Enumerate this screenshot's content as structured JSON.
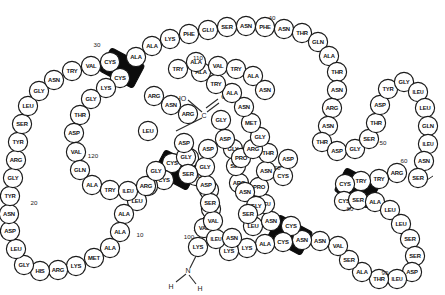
{
  "diagram": {
    "colors": {
      "circle_fill": "#ffffff",
      "circle_stroke": "#1a1a1a",
      "bridge_fill": "#0c0c0c",
      "text": "#111111"
    },
    "n_terminus": {
      "atom": "N",
      "hydrogen_left": "H",
      "hydrogen_right": "H"
    },
    "c_terminus": {
      "hydroxyl": "HO",
      "carbon": "C",
      "oxygen": "O"
    },
    "position_numbers": [
      {
        "label": "10",
        "x": 140,
        "y": 234
      },
      {
        "label": "20",
        "x": 34,
        "y": 202
      },
      {
        "label": "30",
        "x": 97,
        "y": 44
      },
      {
        "label": "40",
        "x": 272,
        "y": 17
      },
      {
        "label": "50",
        "x": 383,
        "y": 142
      },
      {
        "label": "60",
        "x": 404,
        "y": 160
      },
      {
        "label": "70",
        "x": 277,
        "y": 167
      },
      {
        "label": "80",
        "x": 350,
        "y": 208
      },
      {
        "label": "90",
        "x": 385,
        "y": 272
      },
      {
        "label": "100",
        "x": 189,
        "y": 236
      },
      {
        "label": "110",
        "x": 198,
        "y": 57
      },
      {
        "label": "120",
        "x": 93,
        "y": 155
      }
    ],
    "disulfide_bridges": [
      {
        "name": "bridge-cys-30",
        "x": 122,
        "y": 68,
        "angle": -62
      },
      {
        "name": "bridge-cys-117",
        "x": 176,
        "y": 170,
        "angle": -62
      },
      {
        "name": "bridge-cys-80",
        "x": 357,
        "y": 188,
        "angle": -62
      },
      {
        "name": "bridge-cys-85",
        "x": 290,
        "y": 235,
        "angle": -62
      }
    ],
    "residues": [
      {
        "label": "LYS",
        "x": 198,
        "y": 247
      },
      {
        "label": "VAL",
        "x": 204,
        "y": 228
      },
      {
        "label": "PHE",
        "x": 211,
        "y": 209
      },
      {
        "label": "GLY",
        "x": 209,
        "y": 190
      },
      {
        "label": "ARG",
        "x": 196,
        "y": 176
      },
      {
        "label": "ARG",
        "x": 189,
        "y": 158
      },
      {
        "label": "CYS",
        "x": 172,
        "y": 163
      },
      {
        "label": "CYS",
        "x": 164,
        "y": 180
      },
      {
        "label": "GLU",
        "x": 148,
        "y": 186
      },
      {
        "label": "LEU",
        "x": 137,
        "y": 201
      },
      {
        "label": "ALA",
        "x": 124,
        "y": 214
      },
      {
        "label": "ALA",
        "x": 120,
        "y": 232
      },
      {
        "label": "ALA",
        "x": 110,
        "y": 248
      },
      {
        "label": "MET",
        "x": 94,
        "y": 258
      },
      {
        "label": "LYS",
        "x": 76,
        "y": 266
      },
      {
        "label": "ARG",
        "x": 58,
        "y": 270
      },
      {
        "label": "HIS",
        "x": 40,
        "y": 271
      },
      {
        "label": "GLY",
        "x": 24,
        "y": 265
      },
      {
        "label": "LEU",
        "x": 16,
        "y": 249
      },
      {
        "label": "ASP",
        "x": 10,
        "y": 231
      },
      {
        "label": "ASN",
        "x": 9,
        "y": 214
      },
      {
        "label": "TYR",
        "x": 10,
        "y": 196
      },
      {
        "label": "GLY",
        "x": 13,
        "y": 178
      },
      {
        "label": "ARG",
        "x": 16,
        "y": 160
      },
      {
        "label": "TYR",
        "x": 18,
        "y": 142
      },
      {
        "label": "SER",
        "x": 22,
        "y": 124
      },
      {
        "label": "LEU",
        "x": 28,
        "y": 106
      },
      {
        "label": "GLY",
        "x": 39,
        "y": 91
      },
      {
        "label": "ASN",
        "x": 54,
        "y": 80
      },
      {
        "label": "TRY",
        "x": 72,
        "y": 71
      },
      {
        "label": "VAL",
        "x": 91,
        "y": 66
      },
      {
        "label": "CYS",
        "x": 110,
        "y": 62
      },
      {
        "label": "CYS",
        "x": 120,
        "y": 78
      },
      {
        "label": "LYS",
        "x": 106,
        "y": 88
      },
      {
        "label": "GLY",
        "x": 91,
        "y": 99
      },
      {
        "label": "THR",
        "x": 80,
        "y": 115
      },
      {
        "label": "ASP",
        "x": 74,
        "y": 133
      },
      {
        "label": "VAL",
        "x": 76,
        "y": 152
      },
      {
        "label": "GLN",
        "x": 80,
        "y": 170
      },
      {
        "label": "ALA",
        "x": 92,
        "y": 185
      },
      {
        "label": "TRY",
        "x": 110,
        "y": 190
      },
      {
        "label": "ILEU",
        "x": 128,
        "y": 191
      },
      {
        "label": "ARG",
        "x": 146,
        "y": 186
      },
      {
        "label": "GLY",
        "x": 156,
        "y": 171
      },
      {
        "label": "ALA",
        "x": 136,
        "y": 57
      },
      {
        "label": "ALA",
        "x": 152,
        "y": 46
      },
      {
        "label": "LYS",
        "x": 170,
        "y": 39
      },
      {
        "label": "PHE",
        "x": 189,
        "y": 34
      },
      {
        "label": "GLU",
        "x": 208,
        "y": 30
      },
      {
        "label": "SER",
        "x": 227,
        "y": 27
      },
      {
        "label": "ASN",
        "x": 246,
        "y": 26
      },
      {
        "label": "PHE",
        "x": 265,
        "y": 27
      },
      {
        "label": "ASN",
        "x": 284,
        "y": 29
      },
      {
        "label": "THR",
        "x": 302,
        "y": 33
      },
      {
        "label": "GLN",
        "x": 318,
        "y": 42
      },
      {
        "label": "ALA",
        "x": 329,
        "y": 56
      },
      {
        "label": "THR",
        "x": 337,
        "y": 72
      },
      {
        "label": "ASN",
        "x": 337,
        "y": 90
      },
      {
        "label": "ARG",
        "x": 332,
        "y": 108
      },
      {
        "label": "ASN",
        "x": 328,
        "y": 126
      },
      {
        "label": "THR",
        "x": 322,
        "y": 142
      },
      {
        "label": "ASP",
        "x": 337,
        "y": 151
      },
      {
        "label": "GLY",
        "x": 355,
        "y": 149
      },
      {
        "label": "SER",
        "x": 369,
        "y": 139
      },
      {
        "label": "THR",
        "x": 376,
        "y": 123
      },
      {
        "label": "ASP",
        "x": 380,
        "y": 105
      },
      {
        "label": "TYR",
        "x": 388,
        "y": 89
      },
      {
        "label": "GLY",
        "x": 404,
        "y": 82
      },
      {
        "label": "ILEU",
        "x": 418,
        "y": 92
      },
      {
        "label": "LEU",
        "x": 425,
        "y": 108
      },
      {
        "label": "GLN",
        "x": 428,
        "y": 126
      },
      {
        "label": "ILEU",
        "x": 428,
        "y": 144
      },
      {
        "label": "ASN",
        "x": 424,
        "y": 161
      },
      {
        "label": "SER",
        "x": 418,
        "y": 178
      },
      {
        "label": "ARG",
        "x": 397,
        "y": 173
      },
      {
        "label": "TRY",
        "x": 379,
        "y": 179
      },
      {
        "label": "TRY",
        "x": 361,
        "y": 181
      },
      {
        "label": "CYS",
        "x": 345,
        "y": 184
      },
      {
        "label": "CYS",
        "x": 344,
        "y": 201
      },
      {
        "label": "SER",
        "x": 358,
        "y": 200
      },
      {
        "label": "ALA",
        "x": 375,
        "y": 202
      },
      {
        "label": "LEU",
        "x": 390,
        "y": 210
      },
      {
        "label": "LEU",
        "x": 401,
        "y": 224
      },
      {
        "label": "SER",
        "x": 410,
        "y": 239
      },
      {
        "label": "SER",
        "x": 415,
        "y": 256
      },
      {
        "label": "ASP",
        "x": 412,
        "y": 272
      },
      {
        "label": "ILEU",
        "x": 397,
        "y": 279
      },
      {
        "label": "THR",
        "x": 379,
        "y": 279
      },
      {
        "label": "ALA",
        "x": 362,
        "y": 272
      },
      {
        "label": "SER",
        "x": 349,
        "y": 260
      },
      {
        "label": "VAL",
        "x": 338,
        "y": 246
      },
      {
        "label": "ASN",
        "x": 320,
        "y": 241
      },
      {
        "label": "ASN",
        "x": 302,
        "y": 240
      },
      {
        "label": "CYS",
        "x": 291,
        "y": 226
      },
      {
        "label": "CYS",
        "x": 283,
        "y": 242
      },
      {
        "label": "ALA",
        "x": 265,
        "y": 244
      },
      {
        "label": "LYS",
        "x": 247,
        "y": 248
      },
      {
        "label": "LYS",
        "x": 229,
        "y": 251
      },
      {
        "label": "ILEU",
        "x": 216,
        "y": 239
      },
      {
        "label": "VAL",
        "x": 213,
        "y": 221
      },
      {
        "label": "SER",
        "x": 210,
        "y": 203
      },
      {
        "label": "ASP",
        "x": 206,
        "y": 185
      },
      {
        "label": "GLY",
        "x": 205,
        "y": 167
      },
      {
        "label": "ASP",
        "x": 208,
        "y": 149
      },
      {
        "label": "LEU",
        "x": 253,
        "y": 226
      },
      {
        "label": "ASN",
        "x": 271,
        "y": 221
      },
      {
        "label": "ILEU",
        "x": 265,
        "y": 204
      },
      {
        "label": "PRO",
        "x": 259,
        "y": 187
      },
      {
        "label": "ASN",
        "x": 266,
        "y": 171
      },
      {
        "label": "CYS",
        "x": 283,
        "y": 176
      },
      {
        "label": "ASP",
        "x": 288,
        "y": 159
      },
      {
        "label": "ASN",
        "x": 232,
        "y": 238
      },
      {
        "label": "ARG",
        "x": 239,
        "y": 183
      },
      {
        "label": "SER",
        "x": 236,
        "y": 166
      },
      {
        "label": "GLY",
        "x": 233,
        "y": 149
      },
      {
        "label": "PRO",
        "x": 241,
        "y": 158
      },
      {
        "label": "THR",
        "x": 268,
        "y": 153
      },
      {
        "label": "ARG",
        "x": 253,
        "y": 149
      },
      {
        "label": "GLY",
        "x": 260,
        "y": 137
      },
      {
        "label": "MET",
        "x": 251,
        "y": 123
      },
      {
        "label": "ASN",
        "x": 244,
        "y": 107
      },
      {
        "label": "ALA",
        "x": 232,
        "y": 93
      },
      {
        "label": "TRY",
        "x": 216,
        "y": 84
      },
      {
        "label": "ALA",
        "x": 201,
        "y": 72
      },
      {
        "label": "VAL",
        "x": 218,
        "y": 66
      },
      {
        "label": "TRY",
        "x": 236,
        "y": 69
      },
      {
        "label": "ALA",
        "x": 253,
        "y": 76
      },
      {
        "label": "ASN",
        "x": 265,
        "y": 90
      },
      {
        "label": "LEU",
        "x": 148,
        "y": 131
      },
      {
        "label": "GLY",
        "x": 221,
        "y": 120
      },
      {
        "label": "ASP",
        "x": 225,
        "y": 139
      },
      {
        "label": "GLY",
        "x": 186,
        "y": 157
      },
      {
        "label": "ASP",
        "x": 184,
        "y": 143
      },
      {
        "label": "SER",
        "x": 188,
        "y": 174
      },
      {
        "label": "ARG",
        "x": 188,
        "y": 114
      },
      {
        "label": "ASN",
        "x": 171,
        "y": 105
      },
      {
        "label": "ARG",
        "x": 154,
        "y": 96
      },
      {
        "label": "TRY",
        "x": 178,
        "y": 69
      },
      {
        "label": "ALA",
        "x": 196,
        "y": 62
      },
      {
        "label": "ASN",
        "x": 245,
        "y": 192
      },
      {
        "label": "GLY",
        "x": 256,
        "y": 206
      },
      {
        "label": "SER",
        "x": 248,
        "y": 214
      }
    ]
  }
}
